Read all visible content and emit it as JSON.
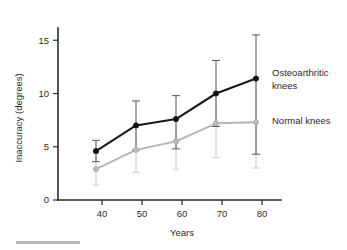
{
  "figure": {
    "background": "#ffffff",
    "width": 347,
    "height": 250
  },
  "axes": {
    "x_title": "Years",
    "y_title": "Inaccuracy (degrees)",
    "x_ticks": [
      "40",
      "50",
      "60",
      "70",
      "80"
    ],
    "y_ticks": [
      "0",
      "5",
      "10",
      "15"
    ]
  },
  "labels": {
    "osteoarthritic_line1": "Osteoarthritic",
    "osteoarthritic_line2": "knees",
    "normal": "Normal knees"
  },
  "colors": {
    "osteoarthritic": "#1a1a1a",
    "normal": "#b5b5b5",
    "axis": "#2b2b2b",
    "error_osteoarthritic": "#555555",
    "error_normal": "#cccccc",
    "rule": "#b9b9b9"
  },
  "chart_data": {
    "type": "line",
    "title": "",
    "xlabel": "Years",
    "ylabel": "Inaccuracy (degrees)",
    "xlim": [
      35,
      85
    ],
    "ylim": [
      0,
      16.5
    ],
    "xticks": [
      40,
      50,
      60,
      70,
      80
    ],
    "yticks": [
      0,
      5,
      10,
      15
    ],
    "grid": false,
    "legend_position": "right-inline",
    "error_bars": "vertical",
    "x": [
      38.5,
      48.5,
      58.5,
      68.5,
      78.5
    ],
    "series": [
      {
        "name": "Osteoarthritic knees",
        "color": "#1a1a1a",
        "values": [
          4.6,
          7.0,
          7.6,
          10.0,
          11.4
        ],
        "err_low": [
          3.6,
          4.7,
          4.8,
          6.9,
          4.3
        ],
        "err_high": [
          5.6,
          9.3,
          9.8,
          13.1,
          15.5
        ]
      },
      {
        "name": "Normal knees",
        "color": "#b5b5b5",
        "values": [
          2.9,
          4.7,
          5.5,
          7.2,
          7.3
        ],
        "err_low": [
          1.4,
          2.6,
          2.9,
          4.0,
          3.0
        ],
        "err_high": [
          4.4,
          6.8,
          7.7,
          10.2,
          11.5
        ]
      }
    ]
  }
}
